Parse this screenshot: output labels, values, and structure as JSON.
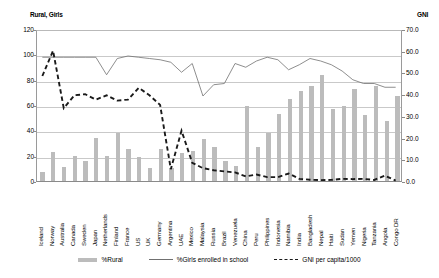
{
  "chart_data": {
    "type": "bar",
    "title": "",
    "left_axis_title": "Rural, Girls",
    "right_axis_title": "GNI",
    "xlabel": "",
    "ylabel": "Rural, Girls",
    "ylim": [
      0,
      120
    ],
    "y2lim": [
      0,
      70
    ],
    "yticks": [
      "0",
      "20",
      "40",
      "60",
      "80",
      "100",
      "120"
    ],
    "y2ticks": [
      "0.0",
      "10.0",
      "20.0",
      "30.0",
      "40.0",
      "50.0",
      "60.0",
      "70.0"
    ],
    "grid": true,
    "legend_position": "bottom",
    "categories": [
      "Iceland",
      "Norway",
      "Australia",
      "Canada",
      "Sweden",
      "Japan",
      "Netherlands",
      "Finland",
      "France",
      "US",
      "UK",
      "Germany",
      "Argentina",
      "UAE",
      "Mexico",
      "Malaysia",
      "Russia",
      "Brazil",
      "Venezuela",
      "China",
      "Peru",
      "Philippines",
      "Indonesia",
      "Namibia",
      "India",
      "Bangladesh",
      "Nepal",
      "Haiti",
      "Sudan",
      "Yemen",
      "Nigeria",
      "Tanzania",
      "Angola",
      "Congo DR"
    ],
    "series": [
      {
        "name": "%Rural",
        "axis": "left",
        "render": "bar",
        "color": "#bcbcbc",
        "values": [
          7,
          23,
          11,
          20,
          16,
          34,
          20,
          38,
          25,
          19,
          10,
          25,
          10,
          22,
          24,
          33,
          27,
          16,
          12,
          59,
          27,
          38,
          53,
          65,
          71,
          75,
          84,
          57,
          59,
          73,
          52,
          75,
          47,
          67
        ]
      },
      {
        "name": "%Girls enrolled in school",
        "axis": "left",
        "render": "line",
        "color": "#707070",
        "values": [
          99,
          99,
          99,
          99,
          99,
          99,
          85,
          98,
          100,
          99,
          98,
          97,
          95,
          87,
          94,
          68,
          77,
          78,
          94,
          91,
          96,
          99,
          97,
          89,
          93,
          98,
          96,
          93,
          88,
          81,
          78,
          78,
          75,
          75
        ]
      },
      {
        "name": "GNI per capita/1000",
        "axis": "right",
        "render": "dashed-line",
        "color": "#1a1a1a",
        "values": [
          49.0,
          60.8,
          34.0,
          40.0,
          40.5,
          38.0,
          40.0,
          37.5,
          38.0,
          43.5,
          40.0,
          35.5,
          5.5,
          23.5,
          8.5,
          6.0,
          5.0,
          4.5,
          4.0,
          2.2,
          3.0,
          1.8,
          1.8,
          3.5,
          1.0,
          0.6,
          0.4,
          0.5,
          1.0,
          0.9,
          1.0,
          0.5,
          2.5,
          0.2
        ]
      }
    ],
    "legend": [
      {
        "label": "%Rural",
        "marker": "bar-swatch"
      },
      {
        "label": "%Girls enrolled in school",
        "marker": "solid-line"
      },
      {
        "label": "GNI per capita/1000",
        "marker": "dashed-line"
      }
    ]
  }
}
